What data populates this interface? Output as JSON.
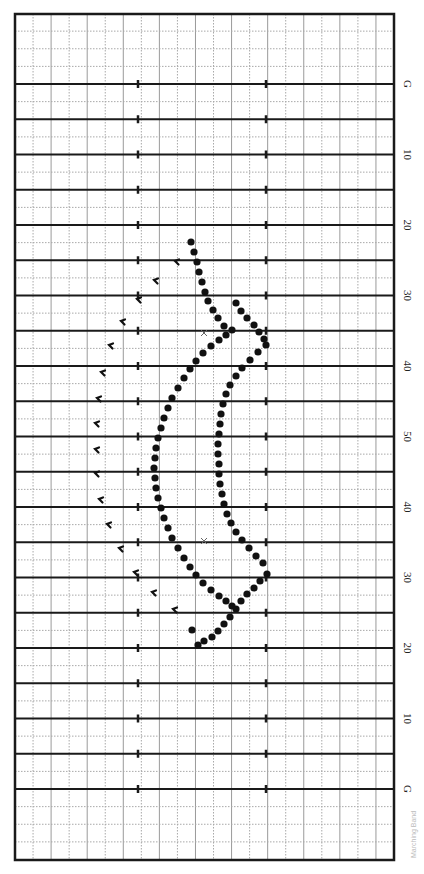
{
  "diagram": {
    "orientation": "field rotated 90 degrees; yard lines run horizontally",
    "field": {
      "left": 15,
      "right": 394,
      "top": 14,
      "bottom": 860
    },
    "yard_lines": {
      "first_y": 84,
      "last_y": 789,
      "count": 21,
      "labels": [
        "G",
        "",
        "10",
        "",
        "20",
        "",
        "30",
        "",
        "40",
        "",
        "50",
        "",
        "40",
        "",
        "30",
        "",
        "20",
        "",
        "10",
        "",
        "G"
      ]
    },
    "hash_marks_x": [
      138,
      266
    ],
    "grid": {
      "columns": 21,
      "minor_rows_per_yard_line": 2
    },
    "colors": {
      "border": "#1a1a1a",
      "yard_line": "#1a1a1a",
      "grid_solid": "#9a9a9a",
      "grid_dotted": "#a8a8a8",
      "dot": "#111111",
      "text": "#222222"
    },
    "footer_text": "Marching Band"
  },
  "chart_data": {
    "type": "scatter",
    "xlabel": "",
    "ylabel": "Yard line",
    "series": [
      {
        "name": "outer-arc",
        "marker": "dot",
        "points": [
          [
            191,
            242
          ],
          [
            194,
            252
          ],
          [
            197,
            262
          ],
          [
            199,
            272
          ],
          [
            202,
            282
          ],
          [
            205,
            292
          ],
          [
            208,
            301
          ],
          [
            213,
            310
          ],
          [
            218,
            318
          ],
          [
            224,
            326
          ],
          [
            232,
            330
          ],
          [
            226,
            335
          ],
          [
            219,
            340
          ],
          [
            211,
            346
          ],
          [
            203,
            353
          ],
          [
            196,
            361
          ],
          [
            190,
            369
          ],
          [
            184,
            378
          ],
          [
            178,
            388
          ],
          [
            172,
            398
          ],
          [
            168,
            408
          ],
          [
            164,
            418
          ],
          [
            161,
            428
          ],
          [
            158,
            438
          ],
          [
            156,
            448
          ],
          [
            155,
            458
          ],
          [
            154,
            468
          ],
          [
            155,
            478
          ],
          [
            156,
            488
          ],
          [
            158,
            498
          ],
          [
            161,
            508
          ],
          [
            164,
            518
          ],
          [
            168,
            528
          ],
          [
            172,
            538
          ],
          [
            178,
            548
          ],
          [
            184,
            558
          ],
          [
            190,
            567
          ],
          [
            196,
            575
          ],
          [
            203,
            583
          ],
          [
            211,
            590
          ],
          [
            219,
            596
          ],
          [
            226,
            601
          ],
          [
            232,
            606
          ]
        ]
      },
      {
        "name": "inner-arc",
        "marker": "dot",
        "points": [
          [
            236,
            303
          ],
          [
            241,
            311
          ],
          [
            247,
            318
          ],
          [
            254,
            325
          ],
          [
            259,
            332
          ],
          [
            264,
            339
          ],
          [
            266,
            345
          ],
          [
            258,
            352
          ],
          [
            250,
            360
          ],
          [
            242,
            368
          ],
          [
            236,
            376
          ],
          [
            230,
            385
          ],
          [
            226,
            394
          ],
          [
            223,
            404
          ],
          [
            221,
            414
          ],
          [
            220,
            424
          ],
          [
            219,
            434
          ],
          [
            218,
            444
          ],
          [
            218,
            454
          ],
          [
            219,
            464
          ],
          [
            219,
            474
          ],
          [
            220,
            484
          ],
          [
            222,
            494
          ],
          [
            224,
            504
          ],
          [
            227,
            514
          ],
          [
            231,
            523
          ],
          [
            236,
            532
          ],
          [
            242,
            540
          ],
          [
            249,
            548
          ],
          [
            256,
            556
          ],
          [
            263,
            563
          ],
          [
            267,
            574
          ],
          [
            260,
            581
          ],
          [
            254,
            588
          ],
          [
            247,
            594
          ],
          [
            241,
            601
          ],
          [
            236,
            609
          ],
          [
            230,
            617
          ],
          [
            224,
            624
          ],
          [
            218,
            631
          ],
          [
            212,
            637
          ],
          [
            204,
            641
          ],
          [
            198,
            645
          ],
          [
            192,
            630
          ]
        ]
      },
      {
        "name": "hook-marks",
        "marker": "hook",
        "points": [
          [
            176,
            262
          ],
          [
            155,
            281
          ],
          [
            138,
            300
          ],
          [
            122,
            322
          ],
          [
            110,
            346
          ],
          [
            102,
            373
          ],
          [
            98,
            399
          ],
          [
            96,
            424
          ],
          [
            96,
            450
          ],
          [
            96,
            474
          ],
          [
            100,
            500
          ],
          [
            108,
            525
          ],
          [
            120,
            549
          ],
          [
            135,
            573
          ],
          [
            153,
            593
          ],
          [
            174,
            610
          ]
        ]
      }
    ],
    "annotations": [
      {
        "type": "x-mark",
        "at": [
          204,
          333
        ]
      },
      {
        "type": "x-mark",
        "at": [
          204,
          541
        ]
      }
    ]
  }
}
